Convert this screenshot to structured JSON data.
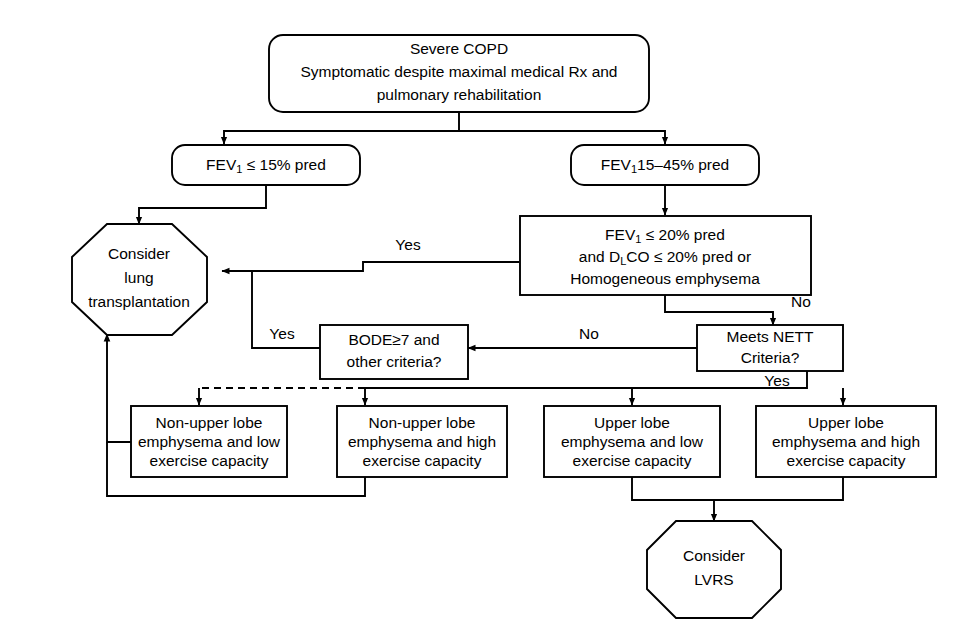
{
  "diagram": {
    "line_color": "#000000",
    "fill_color": "#ffffff",
    "background": "#ffffff"
  },
  "nodes": {
    "severe_copd": {
      "shape": "rounded-rect",
      "line1": "Severe COPD",
      "line2": "Symptomatic despite maximal medical Rx and",
      "line3": "pulmonary rehabilitation"
    },
    "fev1_15": {
      "shape": "rounded-rect",
      "prefix": "FEV",
      "subscript": "1",
      "suffix": " ≤ 15% pred"
    },
    "fev1_15_45": {
      "shape": "rounded-rect",
      "prefix": "FEV",
      "subscript": "1",
      "suffix": "15–45% pred"
    },
    "consider_transplant": {
      "shape": "octagon",
      "line1": "Consider",
      "line2": "lung",
      "line3": "transplantation"
    },
    "fev1_dlco": {
      "shape": "rect",
      "l1_prefix": "FEV",
      "l1_subscript": "1",
      "l1_suffix": " ≤ 20% pred",
      "l2_prefix": "and D",
      "l2_subscript": "L",
      "l2_suffix": "CO ≤ 20% pred or",
      "line3": "Homogeneous emphysema"
    },
    "bode": {
      "shape": "rect",
      "line1": "BODE≥7 and",
      "line2": "other criteria?"
    },
    "nett": {
      "shape": "rect",
      "line1": "Meets NETT",
      "line2": "Criteria?"
    },
    "nonupper_low": {
      "shape": "rect",
      "line1": "Non-upper lobe",
      "line2": "emphysema and low",
      "line3": "exercise capacity"
    },
    "nonupper_high": {
      "shape": "rect",
      "line1": "Non-upper lobe",
      "line2": "emphysema and high",
      "line3": "exercise capacity"
    },
    "upper_low": {
      "shape": "rect",
      "line1": "Upper lobe",
      "line2": "emphysema and low",
      "line3": "exercise capacity"
    },
    "upper_high": {
      "shape": "rect",
      "line1": "Upper lobe",
      "line2": "emphysema and high",
      "line3": "exercise capacity"
    },
    "consider_lvrs": {
      "shape": "octagon",
      "line1": "Consider",
      "line2": "LVRS"
    }
  },
  "edge_labels": {
    "yes_transplant_from_fev1dlco": "Yes",
    "yes_transplant_from_bode": "Yes",
    "no_to_nett": "No",
    "no_nett_to_bode": "No",
    "yes_nett_to_subtypes": "Yes"
  }
}
